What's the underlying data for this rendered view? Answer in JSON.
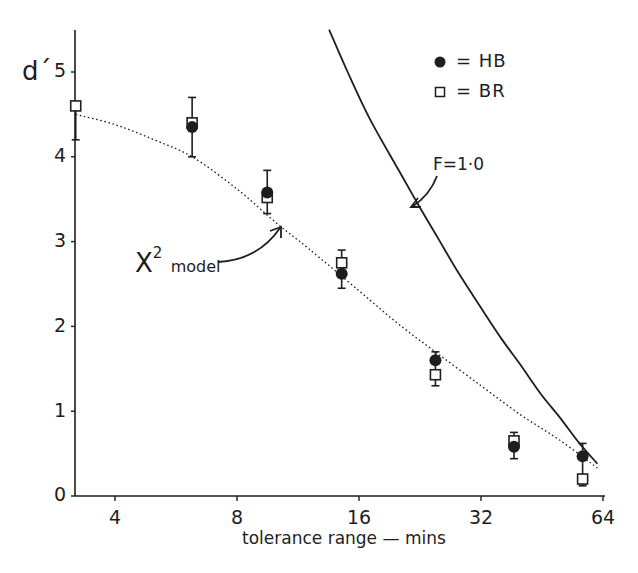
{
  "chart_data": {
    "type": "scatter",
    "title": "",
    "xlabel": "tolerance  range — mins",
    "ylabel": "d´",
    "xscale": "log2",
    "xlim": [
      2.9,
      66
    ],
    "ylim": [
      0,
      5.5
    ],
    "x_ticks": [
      4,
      8,
      16,
      32,
      64
    ],
    "y_ticks": [
      0,
      1,
      2,
      3,
      4,
      5
    ],
    "grid": false,
    "legend_position": "upper right",
    "legend": [
      {
        "marker": "filled-circle",
        "label": "= HB"
      },
      {
        "marker": "open-square",
        "label": "= BR"
      }
    ],
    "x": [
      3.2,
      6.2,
      9.5,
      14.5,
      24.7,
      38.6,
      57
    ],
    "series": [
      {
        "name": "HB",
        "marker": "filled-circle",
        "values": [
          null,
          4.35,
          3.58,
          2.62,
          1.6,
          0.58,
          0.47
        ]
      },
      {
        "name": "BR",
        "marker": "open-square",
        "values": [
          4.6,
          4.4,
          3.52,
          2.75,
          1.43,
          0.65,
          0.2
        ]
      }
    ],
    "error_bars": [
      {
        "x": 3.2,
        "low": 4.2,
        "high": 4.6
      },
      {
        "x": 6.2,
        "low": 4.0,
        "high": 4.7
      },
      {
        "x": 9.5,
        "low": 3.33,
        "high": 3.84
      },
      {
        "x": 14.5,
        "low": 2.45,
        "high": 2.9
      },
      {
        "x": 24.7,
        "low": 1.3,
        "high": 1.7
      },
      {
        "x": 38.6,
        "low": 0.44,
        "high": 0.75
      },
      {
        "x": 57,
        "low": 0.12,
        "high": 0.62
      }
    ],
    "curves": [
      {
        "name": "χ² model",
        "style": "dotted",
        "x": [
          3.2,
          4,
          5,
          6.2,
          8,
          10,
          12,
          16,
          20,
          25,
          32,
          40,
          50,
          62
        ],
        "y": [
          4.5,
          4.38,
          4.2,
          4.0,
          3.62,
          3.22,
          2.92,
          2.42,
          2.03,
          1.68,
          1.3,
          0.96,
          0.66,
          0.33
        ]
      },
      {
        "name": "F=1.0",
        "style": "solid",
        "x": [
          13.5,
          15,
          17,
          20,
          22.5,
          25,
          28,
          32,
          36,
          40,
          45,
          50,
          56,
          62
        ],
        "y": [
          5.5,
          5.0,
          4.45,
          3.85,
          3.42,
          3.05,
          2.65,
          2.22,
          1.85,
          1.55,
          1.2,
          0.93,
          0.62,
          0.38
        ]
      }
    ],
    "annotations": [
      {
        "text": "F=1·0",
        "points_to": "F=1.0 curve"
      },
      {
        "text": "χ² model",
        "points_to": "χ² model curve"
      }
    ]
  },
  "labels": {
    "y_axis": "d´",
    "x_axis": "tolerance  range — mins",
    "y_ticks": [
      "0",
      "1",
      "2",
      "3",
      "4",
      "5"
    ],
    "x_ticks": [
      "4",
      "8",
      "16",
      "32",
      "64"
    ],
    "legend_hb": "=  HB",
    "legend_br": "=  BR",
    "f_annotation": "F=1·0",
    "chi_main": "X",
    "chi_sup": "2",
    "chi_sub": "model"
  },
  "colors": {
    "ink": "#1e1e1e",
    "background": "#ffffff"
  }
}
